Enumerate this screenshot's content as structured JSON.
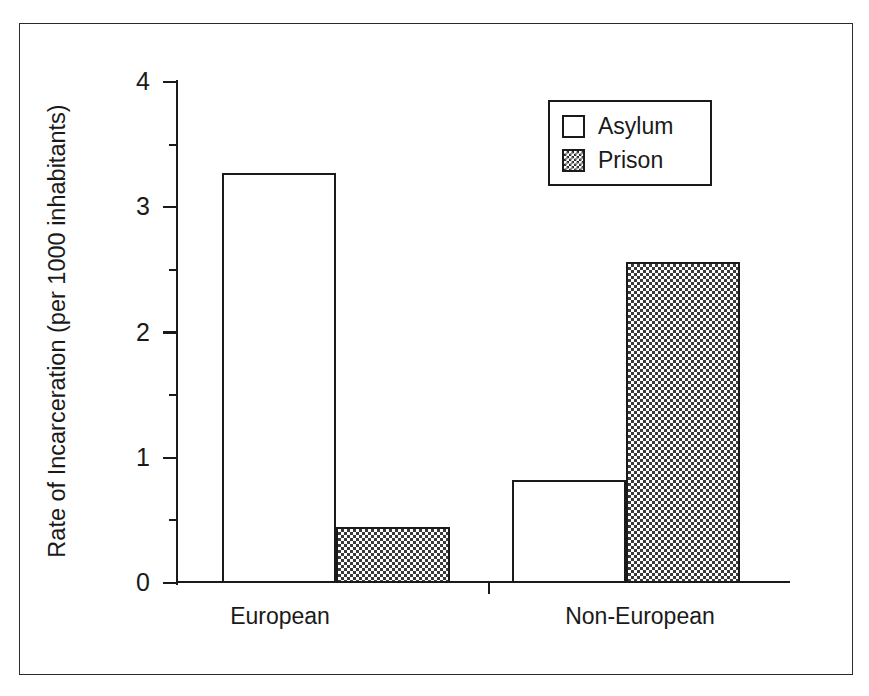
{
  "chart_data": {
    "type": "bar",
    "title": "",
    "subtitle": "",
    "xlabel": "",
    "ylabel": "Rate of Incarceration (per 1000 inhabitants)",
    "categories": [
      "European",
      "Non-European"
    ],
    "series": [
      {
        "name": "Asylum",
        "values": [
          3.27,
          0.82
        ],
        "fill": "white",
        "color": "#ffffff"
      },
      {
        "name": "Prison",
        "values": [
          0.45,
          2.56
        ],
        "fill": "checkered",
        "color": "#3a3a3a"
      }
    ],
    "ylim": [
      0,
      4
    ],
    "ytick_labels": [
      "0",
      "1",
      "2",
      "3",
      "4"
    ],
    "ytick_values": [
      0,
      1,
      2,
      3,
      4
    ],
    "yminor_tick_values": [
      0.5,
      1.5,
      2.5,
      3.5
    ],
    "grid": false,
    "legend_position": "top-right",
    "legend_entries": [
      "Asylum",
      "Prison"
    ],
    "bar_grouping": "grouped-adjacent",
    "frame": true,
    "axis_color": "#1a1a1a",
    "background_color": "#ffffff"
  },
  "figure": {
    "y_axis_title": "Rate of Incarceration (per 1000 inhabitants)",
    "y_ticks": [
      {
        "label": "4",
        "value": 4
      },
      {
        "label": "3",
        "value": 3
      },
      {
        "label": "2",
        "value": 2
      },
      {
        "label": "1",
        "value": 1
      },
      {
        "label": "0",
        "value": 0
      }
    ],
    "x_categories": [
      {
        "label": "European"
      },
      {
        "label": "Non-European"
      }
    ],
    "legend": {
      "items": [
        {
          "label": "Asylum",
          "swatch": "empty-square-swatch"
        },
        {
          "label": "Prison",
          "swatch": "checkered-square-swatch"
        }
      ]
    }
  }
}
